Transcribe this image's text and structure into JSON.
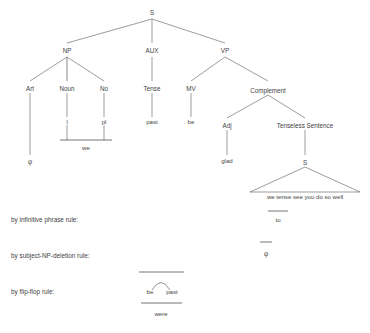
{
  "diagram": {
    "type": "syntax-tree-derivation",
    "tree": {
      "root": {
        "label": "S"
      },
      "level2": [
        {
          "label": "NP"
        },
        {
          "label": "AUX"
        },
        {
          "label": "VP"
        }
      ],
      "level3": [
        {
          "label": "Art"
        },
        {
          "label": "Noun"
        },
        {
          "label": "No"
        },
        {
          "label": "Tense"
        },
        {
          "label": "MV"
        },
        {
          "label": "Complement"
        }
      ],
      "level4": [
        {
          "label": "I"
        },
        {
          "label": "pl"
        },
        {
          "label": "past"
        },
        {
          "label": "be"
        },
        {
          "label": "Adj"
        },
        {
          "label": "Tenseless Sentence"
        }
      ],
      "level5": [
        {
          "label": "φ"
        },
        {
          "label": "we"
        },
        {
          "label": "glad"
        },
        {
          "label": "S"
        }
      ],
      "embedded_sentence_string": "we  tense see you do so well"
    },
    "rules": [
      {
        "label": "by infinitive phrase rule:",
        "result": "to"
      },
      {
        "label": "by subject-NP-deletion rule:",
        "result": "φ"
      },
      {
        "label": "by flip-flop rule:",
        "left": "be",
        "right": "past",
        "result": "were"
      }
    ]
  },
  "colors": {
    "background": "#ffffff",
    "text": "#3f3f3f",
    "line": "#5a5a5a"
  }
}
